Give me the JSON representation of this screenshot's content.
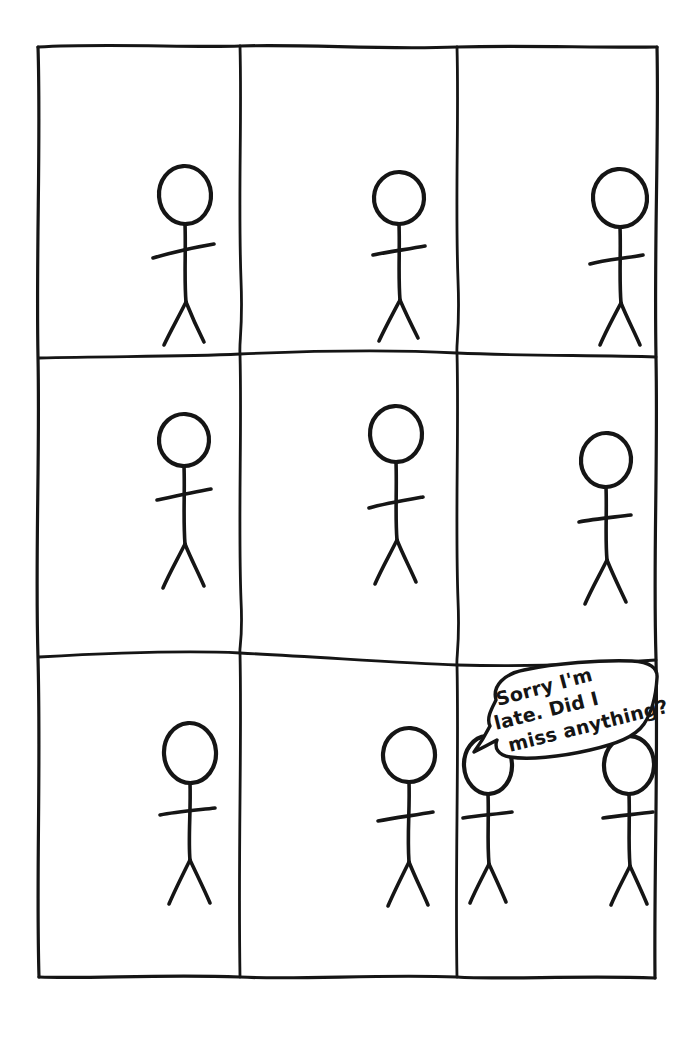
{
  "comic": {
    "title": "Stick Figure Comic Grid",
    "medium": "hand-drawn ink on white paper",
    "background_color": "#ffffff",
    "ink_color": "#151515",
    "grid": {
      "rows": 3,
      "columns": 3,
      "panel_count": 9,
      "frame": {
        "left": 38,
        "top": 46,
        "right": 657,
        "bottom": 978
      },
      "vertical_dividers_x": [
        240,
        457
      ],
      "horizontal_dividers_y": [
        357,
        658
      ]
    },
    "panels": [
      {
        "id": "panel-1",
        "position": "top-left",
        "row": 1,
        "column": 1,
        "figure_count": 1,
        "figures": [
          {
            "name": "stick-figure",
            "cx": 185,
            "head_cy": 195,
            "head_rx": 26,
            "head_ry": 29,
            "scale": 1.0
          }
        ],
        "speech_bubble": null
      },
      {
        "id": "panel-2",
        "position": "top-center",
        "row": 1,
        "column": 2,
        "figure_count": 1,
        "figures": [
          {
            "name": "stick-figure",
            "cx": 399,
            "head_cy": 198,
            "head_rx": 25,
            "head_ry": 26,
            "scale": 1.0
          }
        ],
        "speech_bubble": null
      },
      {
        "id": "panel-3",
        "position": "top-right",
        "row": 1,
        "column": 3,
        "figure_count": 1,
        "figures": [
          {
            "name": "stick-figure",
            "cx": 620,
            "head_cy": 198,
            "head_rx": 27,
            "head_ry": 29,
            "scale": 1.0
          }
        ],
        "speech_bubble": null
      },
      {
        "id": "panel-4",
        "position": "middle-left",
        "row": 2,
        "column": 1,
        "figure_count": 1,
        "figures": [
          {
            "name": "stick-figure",
            "cx": 184,
            "head_cy": 440,
            "head_rx": 25,
            "head_ry": 26,
            "scale": 1.0
          }
        ],
        "speech_bubble": null
      },
      {
        "id": "panel-5",
        "position": "middle-center",
        "row": 2,
        "column": 2,
        "figure_count": 1,
        "figures": [
          {
            "name": "stick-figure",
            "cx": 396,
            "head_cy": 434,
            "head_rx": 26,
            "head_ry": 28,
            "scale": 1.0
          }
        ],
        "speech_bubble": null
      },
      {
        "id": "panel-6",
        "position": "middle-right",
        "row": 2,
        "column": 3,
        "figure_count": 1,
        "figures": [
          {
            "name": "stick-figure",
            "cx": 606,
            "head_cy": 460,
            "head_rx": 25,
            "head_ry": 27,
            "scale": 1.0
          }
        ],
        "speech_bubble": null
      },
      {
        "id": "panel-7",
        "position": "bottom-left",
        "row": 3,
        "column": 1,
        "figure_count": 1,
        "figures": [
          {
            "name": "stick-figure",
            "cx": 190,
            "head_cy": 753,
            "head_rx": 26,
            "head_ry": 30,
            "scale": 1.0
          }
        ],
        "speech_bubble": null
      },
      {
        "id": "panel-8",
        "position": "bottom-center",
        "row": 3,
        "column": 2,
        "figure_count": 1,
        "figures": [
          {
            "name": "stick-figure",
            "cx": 409,
            "head_cy": 755,
            "head_rx": 26,
            "head_ry": 27,
            "scale": 1.0
          }
        ],
        "speech_bubble": null
      },
      {
        "id": "panel-9",
        "position": "bottom-right",
        "row": 3,
        "column": 3,
        "figure_count": 2,
        "figures": [
          {
            "name": "stick-figure-speaker",
            "cx": 488,
            "head_cy": 765,
            "head_rx": 24,
            "head_ry": 29,
            "scale": 0.92
          },
          {
            "name": "stick-figure-listener",
            "cx": 629,
            "head_cy": 765,
            "head_rx": 25,
            "head_ry": 29,
            "scale": 0.92
          }
        ],
        "speech_bubble": {
          "name": "speech-bubble",
          "text_lines": [
            "Sorry I'm",
            "late. Did I",
            "miss anything?"
          ],
          "full_text": "Sorry I'm late. Did I miss anything?",
          "spoken_by": "stick-figure-speaker",
          "tail_target": {
            "x": 500,
            "y": 760
          }
        }
      }
    ]
  }
}
